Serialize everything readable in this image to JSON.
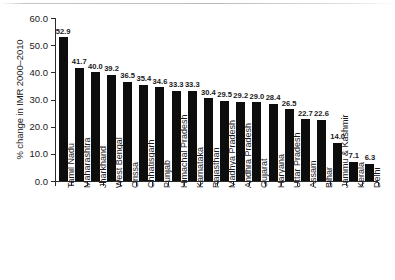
{
  "chart_data": {
    "type": "bar",
    "title": "",
    "subtitle": "",
    "xlabel": "",
    "ylabel": "% change in IMR 2000–2010",
    "ylim": [
      0.0,
      60.0
    ],
    "ytick_labels": [
      "0.0",
      "10.0",
      "20.0",
      "30.0",
      "40.0",
      "50.0",
      "60.0"
    ],
    "ytick_values": [
      0.0,
      10.0,
      20.0,
      30.0,
      40.0,
      50.0,
      60.0
    ],
    "grid": false,
    "legend": false,
    "bar_color": "#0d0d0d",
    "categories": [
      "Tamil Nadu",
      "Maharashtra",
      "Jharkhand",
      "West Bengal",
      "Orissa",
      "Chhatisgarh",
      "Punjab",
      "Himachal Pradesh",
      "Karnataka",
      "Rajasthan",
      "Madhya Pradesh",
      "Andhra Pradesh",
      "Gujarat",
      "Haryana",
      "Uttar Pradesh",
      "Assam",
      "Bihar",
      "Jammu & Kashmir",
      "Kerala",
      "Delhi"
    ],
    "values": [
      52.9,
      41.7,
      40.0,
      39.2,
      36.5,
      35.4,
      34.6,
      33.3,
      33.3,
      30.4,
      29.5,
      29.2,
      29.0,
      28.4,
      26.5,
      22.7,
      22.6,
      14.0,
      7.1,
      6.3
    ],
    "data_labels": [
      "52.9",
      "41.7",
      "40.0",
      "39.2",
      "36.5",
      "35.4",
      "34.6",
      "33.3",
      "33.3",
      "30.4",
      "29.5",
      "29.2",
      "29.0",
      "28.4",
      "26.5",
      "22.7",
      "22.6",
      "14.0",
      "7.1",
      "6.3"
    ]
  }
}
